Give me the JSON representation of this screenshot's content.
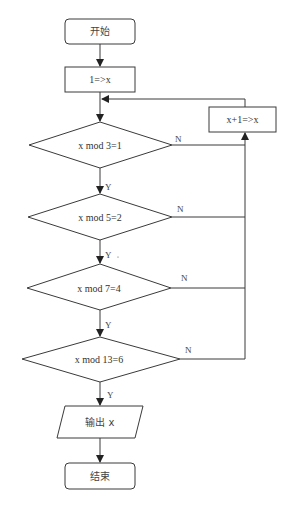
{
  "diagram": {
    "type": "flowchart",
    "nodes": {
      "start": {
        "label": "开始",
        "shape": "rounded-rect"
      },
      "init": {
        "label": "1=>x",
        "shape": "rect"
      },
      "increment": {
        "label": "x+1=>x",
        "shape": "rect"
      },
      "cond1": {
        "label": "x mod 3=1",
        "shape": "diamond"
      },
      "cond2": {
        "label": "x mod 5=2",
        "shape": "diamond"
      },
      "cond3": {
        "label": "x mod 7=4",
        "shape": "diamond"
      },
      "cond4": {
        "label": "x mod 13=6",
        "shape": "diamond"
      },
      "output": {
        "label": "输出 x",
        "shape": "parallelogram"
      },
      "end": {
        "label": "结束",
        "shape": "rounded-rect"
      }
    },
    "edge_labels": {
      "cond1_yes": "Y",
      "cond1_no": "N",
      "cond2_yes": "Y",
      "cond2_no": "N",
      "cond3_yes": "Y",
      "cond3_no": "N",
      "cond4_yes": "Y",
      "cond4_no": "N"
    },
    "edges": [
      {
        "from": "start",
        "to": "init"
      },
      {
        "from": "init",
        "to": "cond1"
      },
      {
        "from": "cond1",
        "to": "cond2",
        "label": "Y"
      },
      {
        "from": "cond1",
        "to": "increment",
        "label": "N"
      },
      {
        "from": "cond2",
        "to": "cond3",
        "label": "Y"
      },
      {
        "from": "cond2",
        "to": "increment",
        "label": "N"
      },
      {
        "from": "cond3",
        "to": "cond4",
        "label": "Y"
      },
      {
        "from": "cond3",
        "to": "increment",
        "label": "N"
      },
      {
        "from": "cond4",
        "to": "output",
        "label": "Y"
      },
      {
        "from": "cond4",
        "to": "increment",
        "label": "N"
      },
      {
        "from": "increment",
        "to": "cond1"
      },
      {
        "from": "output",
        "to": "end"
      }
    ]
  }
}
